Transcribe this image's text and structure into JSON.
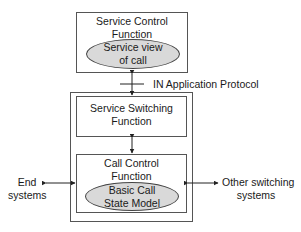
{
  "diagram": {
    "scf": {
      "title_line1": "Service Control",
      "title_line2": "Function",
      "ellipse_line1": "Service view",
      "ellipse_line2": "of call"
    },
    "protocol_label": "IN Application Protocol",
    "ssf": {
      "title_line1": "Service Switching",
      "title_line2": "Function"
    },
    "ccf": {
      "title_line1": "Call Control",
      "title_line2": "Function",
      "ellipse_line1": "Basic Call",
      "ellipse_line2": "State Model"
    },
    "left_endpoint": {
      "line1": "End",
      "line2": "systems"
    },
    "right_endpoint": {
      "line1": "Other switching",
      "line2": "systems"
    },
    "colors": {
      "ellipse_fill": "#d9d9d9",
      "stroke": "#555555"
    }
  }
}
